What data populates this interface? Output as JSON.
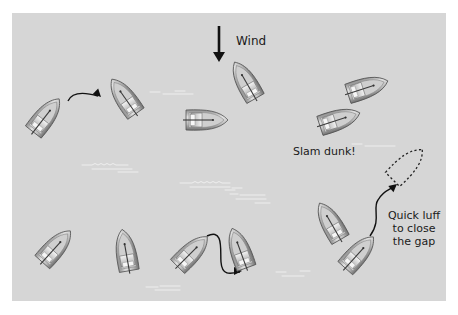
{
  "diagram": {
    "background_color": "#d6d6d6",
    "panel": {
      "x": 12,
      "y": 13,
      "width": 434,
      "height": 288
    },
    "labels": {
      "wind": "Wind",
      "slam_dunk": "Slam dunk!",
      "quick_luff_line1": "Quick luff",
      "quick_luff_line2": "to close",
      "quick_luff_line3": "the gap"
    },
    "wind_arrow": {
      "x": 219,
      "y1": 26,
      "y2": 62
    },
    "boats": [
      {
        "id": "boat-1",
        "x": 45,
        "y": 117,
        "rotation": 38
      },
      {
        "id": "boat-2",
        "x": 125,
        "y": 98,
        "rotation": -35
      },
      {
        "id": "boat-3",
        "x": 205,
        "y": 120,
        "rotation": 90
      },
      {
        "id": "boat-4",
        "x": 246,
        "y": 82,
        "rotation": -30
      },
      {
        "id": "boat-5",
        "x": 366,
        "y": 88,
        "rotation": 72
      },
      {
        "id": "boat-6",
        "x": 338,
        "y": 120,
        "rotation": 72
      },
      {
        "id": "boat-7",
        "x": 55,
        "y": 248,
        "rotation": 42
      },
      {
        "id": "boat-8",
        "x": 126,
        "y": 252,
        "rotation": -10
      },
      {
        "id": "boat-9",
        "x": 191,
        "y": 253,
        "rotation": 45
      },
      {
        "id": "boat-10",
        "x": 240,
        "y": 250,
        "rotation": -20
      },
      {
        "id": "boat-11",
        "x": 331,
        "y": 223,
        "rotation": -30
      },
      {
        "id": "boat-12",
        "x": 358,
        "y": 254,
        "rotation": 42
      }
    ],
    "ghost_boat": {
      "x": 406,
      "y": 166,
      "rotation": 45
    },
    "arrows": [
      {
        "id": "arrow-tack",
        "d": "M 68 101 C 72 92, 84 92, 98 96",
        "head": [
          101,
          97,
          45
        ]
      },
      {
        "id": "arrow-dip",
        "d": "M 207 236 C 224 228, 220 250, 221 262 C 222 276, 230 274, 240 272",
        "head": [
          242,
          271,
          0
        ]
      },
      {
        "id": "arrow-luff",
        "d": "M 370 236 C 382 220, 372 208, 378 200 C 384 190, 390 190, 395 186",
        "head": [
          397,
          184,
          -40
        ]
      }
    ],
    "waves": [
      "M 150 92 l 10 0 M 163 94 l 30 0 M 175 91 l 10 0",
      "M 352 144 l 10 0 M 365 146 l 30 0",
      "M 82 165 l 10 0 q 3 -3 6 0 q 3 -3 6 0 q 3 -3 6 0 q 3 -3 6 0 l 12 0 M 92 169 l 40 0 M 118 172 l 20 0",
      "M 180 183 l 12 0 q 3 -3 6 0 q 3 -3 6 0 q 3 -3 6 0 q 3 -3 6 0 q 3 -3 6 0 l 8 0 M 190 187 l 40 0 M 225 190 l 10 0",
      "M 232 188 l 10 0 M 240 195 l 25 0",
      "M 146 287 l 12 0 M 160 286 l 20 0 M 155 290 l 25 0",
      "M 276 272 l 10 0 M 282 276 l 22 0 M 300 271 l 10 0",
      "M 230 194 l 8 0 M 236 199 l 30 0 M 255 203 l 15 0"
    ]
  }
}
